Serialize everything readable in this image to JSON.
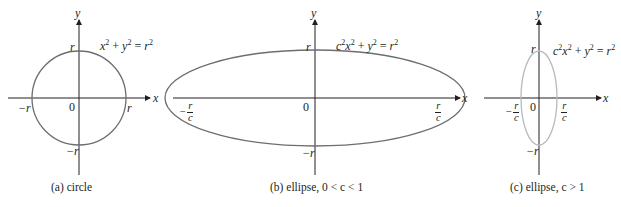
{
  "panels": [
    {
      "id": "a",
      "caption": "(a) circle",
      "equation": {
        "parts": [
          "x",
          "2",
          " + ",
          "y",
          "2",
          " = ",
          "r",
          "2"
        ]
      },
      "axis_labels": {
        "x": "x",
        "y": "y"
      },
      "ticks": {
        "top": "r",
        "bottom": "−r",
        "left": "−r",
        "right": "r",
        "origin": "0"
      }
    },
    {
      "id": "b",
      "caption": "(b) ellipse, 0 < c < 1",
      "equation": {
        "parts": [
          "c",
          "2",
          "x",
          "2",
          " + ",
          "y",
          "2",
          " = ",
          "r",
          "2"
        ]
      },
      "axis_labels": {
        "x": "x",
        "y": "y"
      },
      "ticks": {
        "top": "r",
        "bottom": "−r",
        "left_sign": "−",
        "left_num": "r",
        "left_den": "c",
        "right_num": "r",
        "right_den": "c",
        "origin": "0"
      }
    },
    {
      "id": "c",
      "caption": "(c) ellipse,  c > 1",
      "equation": {
        "parts": [
          "c",
          "2",
          "x",
          "2",
          " + ",
          "y",
          "2",
          " = ",
          "r",
          "2"
        ]
      },
      "axis_labels": {
        "x": "x",
        "y": "y"
      },
      "ticks": {
        "top": "r",
        "bottom": "−r",
        "left_sign": "−",
        "left_num": "r",
        "left_den": "c",
        "right_num": "r",
        "right_den": "c",
        "origin": "0"
      }
    }
  ],
  "colors": {
    "axis": "#231f20",
    "curve_dark": "#6d6e71",
    "curve_light": "#b8b9bb"
  }
}
